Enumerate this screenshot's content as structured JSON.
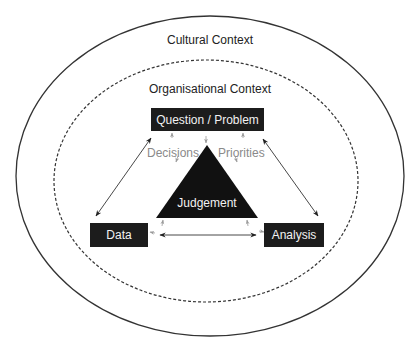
{
  "contexts": {
    "outer": {
      "label": "Cultural Context",
      "line_style": "solid"
    },
    "inner": {
      "label": "Organisational Context",
      "line_style": "dashed"
    }
  },
  "nodes": {
    "question": {
      "label": "Question / Problem"
    },
    "data": {
      "label": "Data"
    },
    "analysis": {
      "label": "Analysis"
    },
    "judgement": {
      "label": "Judgement",
      "shape": "triangle"
    }
  },
  "flow_labels": {
    "decisions": "Decisions",
    "priorities": "Priorities"
  },
  "connections": [
    {
      "from": "Question / Problem",
      "to": "Data",
      "type": "double-arrow"
    },
    {
      "from": "Question / Problem",
      "to": "Analysis",
      "type": "double-arrow"
    },
    {
      "from": "Data",
      "to": "Analysis",
      "type": "double-arrow"
    },
    {
      "from": "Judgement",
      "to": "Question / Problem",
      "label": "Decisions",
      "type": "grey-arrow"
    },
    {
      "from": "Judgement",
      "to": "Question / Problem",
      "label": "Priorities",
      "type": "grey-arrow"
    },
    {
      "from": "Judgement",
      "to": "Data",
      "type": "grey-arrow"
    },
    {
      "from": "Judgement",
      "to": "Analysis",
      "type": "grey-arrow"
    }
  ],
  "colors": {
    "box_fill": "#1c1c1c",
    "box_text": "#f2f2f2",
    "line": "#333333",
    "grey_arrow": "#9a9a9a"
  }
}
